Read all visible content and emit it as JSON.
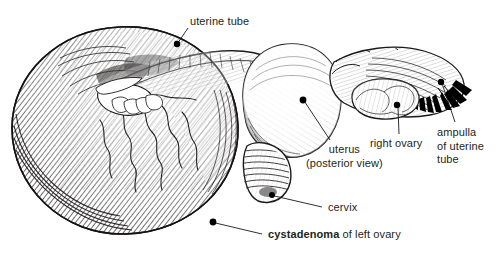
{
  "figure": {
    "name": "cystadenoma-of-left-ovary-illustration",
    "medium": "pen-and-ink line drawing",
    "background_color": "#ffffff",
    "ink_color": "#231f20",
    "labels": [
      {
        "id": "uterine-tube",
        "text": "uterine  tube",
        "bold_prefix": "",
        "lines": [
          "uterine  tube"
        ],
        "align": "left",
        "marker": {
          "x": 177,
          "y": 44
        },
        "leader": {
          "x1": 188,
          "y1": 28,
          "x2": 178,
          "y2": 43
        }
      },
      {
        "id": "uterus",
        "line1": "uterus",
        "line2": "(posterior view)",
        "align": "center",
        "marker": {
          "x": 303,
          "y": 100
        },
        "leader": {
          "x1": 330,
          "y1": 140,
          "x2": 304,
          "y2": 101
        }
      },
      {
        "id": "right-ovary",
        "text": "right ovary",
        "align": "center",
        "marker": {
          "x": 397,
          "y": 105
        },
        "leader": {
          "x1": 399,
          "y1": 134,
          "x2": 398,
          "y2": 107
        }
      },
      {
        "id": "ampulla-of-uterine-tube",
        "line1": "ampulla",
        "line2": "of uterine",
        "line3": "tube",
        "align": "left",
        "marker": {
          "x": 441,
          "y": 82
        },
        "leader": {
          "x1": 455,
          "y1": 122,
          "x2": 442,
          "y2": 84
        }
      },
      {
        "id": "cervix",
        "text": "cervix",
        "align": "left",
        "marker": {
          "x": 272,
          "y": 195
        },
        "leader": {
          "x1": 322,
          "y1": 207,
          "x2": 274,
          "y2": 196
        }
      },
      {
        "id": "cystadenoma",
        "bold_text": "cystadenoma",
        "rest_text": " of left ovary",
        "align": "left",
        "marker": {
          "x": 213,
          "y": 222
        },
        "leader": {
          "x1": 262,
          "y1": 234,
          "x2": 215,
          "y2": 223
        }
      }
    ]
  }
}
